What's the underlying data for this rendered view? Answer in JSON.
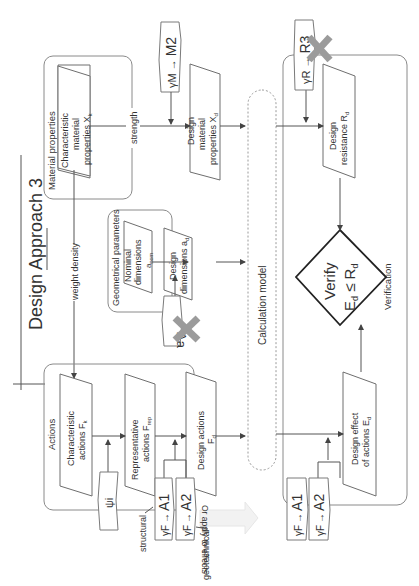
{
  "title": "Design Approach 3",
  "groups": {
    "material_properties": "Material properties",
    "geometrical_parameters": "Geometrical parameters",
    "actions": "Actions",
    "calculation_model": "Calculation model",
    "verification": "Verification"
  },
  "nodes": {
    "char_material": [
      "Characteristic",
      "material",
      "properties X",
      "k"
    ],
    "design_material": [
      "Design",
      "material",
      "properties X",
      "d"
    ],
    "nominal_dims": [
      "Nominal",
      "dimensions",
      "a",
      "nom"
    ],
    "design_dims": [
      "Design",
      "dimensions a",
      "d"
    ],
    "char_actions": [
      "Characteristic",
      "actions F",
      "k"
    ],
    "rep_actions": [
      "Representative",
      "actions F",
      "rep"
    ],
    "design_actions": [
      "Design actions",
      "F",
      "d"
    ],
    "design_resistance": [
      "Design",
      "resistance R",
      "d"
    ],
    "design_effect": [
      "Design effect",
      "of actions E",
      "d"
    ],
    "verify": [
      "Verify",
      "E",
      "d",
      " ≤ R",
      "d"
    ]
  },
  "edge_labels": {
    "strength": "strength",
    "weight_density": "weight density",
    "structural": "structural",
    "geotechnical": "geotechnical",
    "apply_to_effects": "Or apply to effects"
  },
  "factors": {
    "gamma_m": {
      "symbol": "γM",
      "arrow": "→",
      "set": "M2",
      "crossed": false
    },
    "gamma_r": {
      "symbol": "γR",
      "arrow": "→",
      "set": "R3",
      "crossed": true
    },
    "delta_a": {
      "symbol": "Δa",
      "crossed": true
    },
    "psi": {
      "symbol": "ψi"
    },
    "gamma_f_actions_a1": {
      "symbol": "γF",
      "arrow": "→",
      "set": "A1"
    },
    "gamma_f_actions_a2": {
      "symbol": "γF",
      "arrow": "→",
      "set": "A2"
    },
    "gamma_f_effects_a1": {
      "symbol": "γF",
      "arrow": "→",
      "set": "A1"
    },
    "gamma_f_effects_a2": {
      "symbol": "γF",
      "arrow": "→",
      "set": "A2"
    }
  },
  "colors": {
    "line": "#555555",
    "box": "#8a8a8a",
    "cross": "#9b9b9b",
    "text": "#333333"
  }
}
